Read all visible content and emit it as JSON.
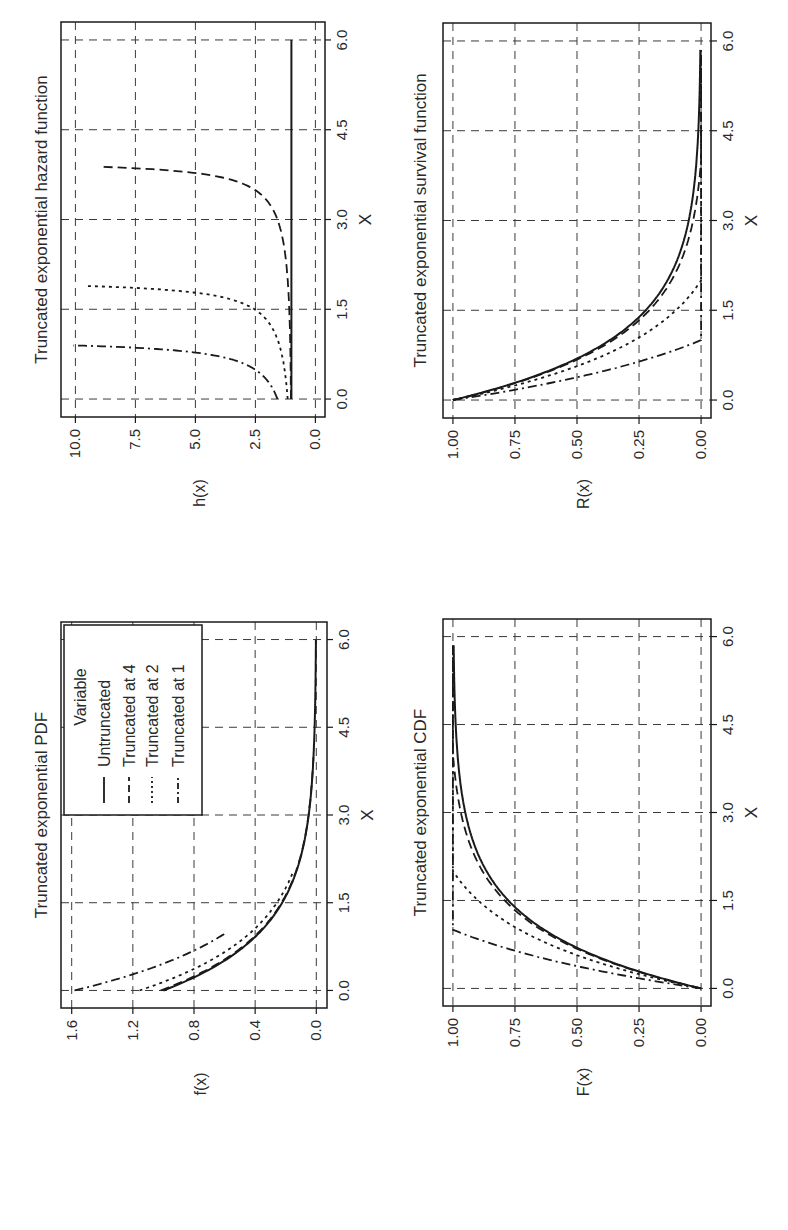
{
  "figure": {
    "rotation_deg": -90,
    "layout": "2x2 grid of line charts, page rotated 90 degrees counter-clockwise",
    "colors": {
      "background": "#ffffff",
      "ink": "#1a1a1a",
      "grid": "#3a3a3a"
    }
  },
  "legend": {
    "title": "Variable",
    "entries": [
      {
        "label": "Untruncated",
        "linestyle": "solid"
      },
      {
        "label": "Truncated at 4",
        "linestyle": "long-dash"
      },
      {
        "label": "Truncated at 2",
        "linestyle": "dotted"
      },
      {
        "label": "Truncated at 1",
        "linestyle": "dash-dot"
      }
    ]
  },
  "panels": {
    "pdf": {
      "title": "Truncated exponential PDF",
      "xlabel": "X",
      "ylabel": "f(x)",
      "xticks": [
        "0.0",
        "1.5",
        "3.0",
        "4.5",
        "6.0"
      ],
      "yticks": [
        "0.0",
        "0.4",
        "0.8",
        "1.2",
        "1.6"
      ]
    },
    "cdf": {
      "title": "Truncated exponential CDF",
      "xlabel": "X",
      "ylabel": "F(x)",
      "xticks": [
        "0.0",
        "1.5",
        "3.0",
        "4.5",
        "6.0"
      ],
      "yticks": [
        "0.00",
        "0.25",
        "0.50",
        "0.75",
        "1.00"
      ]
    },
    "hazard": {
      "title": "Truncated exponential hazard function",
      "xlabel": "X",
      "ylabel": "h(x)",
      "xticks": [
        "0.0",
        "1.5",
        "3.0",
        "4.5",
        "6.0"
      ],
      "yticks": [
        "0.0",
        "2.5",
        "5.0",
        "7.5",
        "10.0"
      ]
    },
    "survival": {
      "title": "Truncated exponential survival function",
      "xlabel": "X",
      "ylabel": "R(x)",
      "xticks": [
        "0.0",
        "1.5",
        "3.0",
        "4.5",
        "6.0"
      ],
      "yticks": [
        "0.00",
        "0.25",
        "0.50",
        "0.75",
        "1.00"
      ]
    }
  },
  "chart_data": [
    {
      "type": "line",
      "title": "Truncated exponential PDF",
      "xlabel": "X",
      "ylabel": "f(x)",
      "xlim": [
        -0.3,
        6.3
      ],
      "ylim": [
        -0.07,
        1.67
      ],
      "xticks": [
        0,
        1.5,
        3,
        4.5,
        6
      ],
      "yticks": [
        0,
        0.4,
        0.8,
        1.2,
        1.6
      ],
      "grid": true,
      "legend_position": "upper right",
      "x": [
        0,
        0.25,
        0.5,
        0.75,
        1.0,
        1.5,
        2.0,
        2.5,
        3.0,
        3.5,
        4.0,
        4.5,
        5.0,
        5.5,
        6.0
      ],
      "series": [
        {
          "name": "Untruncated",
          "linestyle": "solid",
          "values": [
            1.0,
            0.779,
            0.607,
            0.472,
            0.368,
            0.223,
            0.135,
            0.082,
            0.05,
            0.03,
            0.018,
            0.011,
            0.007,
            0.004,
            0.002
          ]
        },
        {
          "name": "Truncated at 4",
          "linestyle": "long-dash",
          "values": [
            1.019,
            0.793,
            0.618,
            0.481,
            0.375,
            0.227,
            0.138,
            0.084,
            0.051,
            0.031,
            0.019,
            null,
            null,
            null,
            null
          ]
        },
        {
          "name": "Truncated at 2",
          "linestyle": "dotted",
          "values": [
            1.157,
            0.901,
            0.702,
            0.546,
            0.426,
            0.258,
            0.156,
            null,
            null,
            null,
            null,
            null,
            null,
            null,
            null
          ]
        },
        {
          "name": "Truncated at 1",
          "linestyle": "dash-dot",
          "values": [
            1.582,
            1.232,
            0.96,
            0.747,
            0.582,
            null,
            null,
            null,
            null,
            null,
            null,
            null,
            null,
            null,
            null
          ]
        }
      ]
    },
    {
      "type": "line",
      "title": "Truncated exponential CDF",
      "xlabel": "X",
      "ylabel": "F(x)",
      "xlim": [
        -0.3,
        6.3
      ],
      "ylim": [
        -0.04,
        1.04
      ],
      "xticks": [
        0,
        1.5,
        3,
        4.5,
        6
      ],
      "yticks": [
        0,
        0.25,
        0.5,
        0.75,
        1.0
      ],
      "grid": true,
      "x": [
        0,
        0.25,
        0.5,
        0.75,
        1.0,
        1.5,
        2.0,
        2.5,
        3.0,
        3.5,
        4.0,
        4.5,
        5.0,
        5.5,
        6.0
      ],
      "series": [
        {
          "name": "Untruncated",
          "linestyle": "solid",
          "values": [
            0,
            0.221,
            0.393,
            0.528,
            0.632,
            0.777,
            0.865,
            0.918,
            0.95,
            0.97,
            0.982,
            0.989,
            0.993,
            0.996,
            0.998
          ]
        },
        {
          "name": "Truncated at 4",
          "linestyle": "long-dash",
          "values": [
            0,
            0.225,
            0.401,
            0.538,
            0.644,
            0.792,
            0.881,
            0.936,
            0.968,
            0.989,
            1.0,
            1.0,
            1.0,
            1.0,
            1.0
          ]
        },
        {
          "name": "Truncated at 2",
          "linestyle": "dotted",
          "values": [
            0,
            0.255,
            0.455,
            0.611,
            0.731,
            0.899,
            1.0,
            1.0,
            1.0,
            1.0,
            1.0,
            1.0,
            1.0,
            1.0,
            1.0
          ]
        },
        {
          "name": "Truncated at 1",
          "linestyle": "dash-dot",
          "values": [
            0,
            0.35,
            0.622,
            0.835,
            1.0,
            1.0,
            1.0,
            1.0,
            1.0,
            1.0,
            1.0,
            1.0,
            1.0,
            1.0,
            1.0
          ]
        }
      ]
    },
    {
      "type": "line",
      "title": "Truncated exponential hazard function",
      "xlabel": "X",
      "ylabel": "h(x)",
      "xlim": [
        -0.3,
        6.3
      ],
      "ylim": [
        -0.4,
        10.6
      ],
      "xticks": [
        0,
        1.5,
        3,
        4.5,
        6
      ],
      "yticks": [
        0,
        2.5,
        5,
        7.5,
        10
      ],
      "grid": true,
      "x": [
        0,
        0.25,
        0.5,
        0.75,
        0.9,
        1.0,
        1.5,
        1.75,
        1.9,
        2.0,
        2.5,
        3.0,
        3.5,
        3.75,
        3.9,
        4.0,
        4.5,
        5.0,
        5.5,
        6.0
      ],
      "series": [
        {
          "name": "Untruncated",
          "linestyle": "solid",
          "values": [
            1.0,
            1.0,
            1.0,
            1.0,
            1.0,
            1.0,
            1.0,
            1.0,
            1.0,
            1.0,
            1.0,
            1.0,
            1.0,
            1.0,
            1.0,
            1.0,
            1.0,
            1.0,
            1.0,
            1.0
          ]
        },
        {
          "name": "Truncated at 4",
          "linestyle": "long-dash",
          "values": [
            1.02,
            1.02,
            1.03,
            1.04,
            1.04,
            1.04,
            1.07,
            1.09,
            1.11,
            1.12,
            1.22,
            1.45,
            2.54,
            4.52,
            10.5,
            null,
            null,
            null,
            null,
            null
          ]
        },
        {
          "name": "Truncated at 2",
          "linestyle": "dotted",
          "values": [
            1.16,
            1.22,
            1.3,
            1.43,
            1.54,
            1.58,
            2.54,
            4.52,
            10.5,
            null,
            null,
            null,
            null,
            null,
            null,
            null,
            null,
            null,
            null,
            null
          ]
        },
        {
          "name": "Truncated at 1",
          "linestyle": "dash-dot",
          "values": [
            1.58,
            1.88,
            2.54,
            4.52,
            10.5,
            null,
            null,
            null,
            null,
            null,
            null,
            null,
            null,
            null,
            null,
            null,
            null,
            null,
            null,
            null
          ]
        }
      ]
    },
    {
      "type": "line",
      "title": "Truncated exponential survival function",
      "xlabel": "X",
      "ylabel": "R(x)",
      "xlim": [
        -0.3,
        6.3
      ],
      "ylim": [
        -0.04,
        1.04
      ],
      "xticks": [
        0,
        1.5,
        3,
        4.5,
        6
      ],
      "yticks": [
        0,
        0.25,
        0.5,
        0.75,
        1.0
      ],
      "grid": true,
      "x": [
        0,
        0.25,
        0.5,
        0.75,
        1.0,
        1.5,
        2.0,
        2.5,
        3.0,
        3.5,
        4.0,
        4.5,
        5.0,
        5.5,
        6.0
      ],
      "series": [
        {
          "name": "Untruncated",
          "linestyle": "solid",
          "values": [
            1.0,
            0.779,
            0.607,
            0.472,
            0.368,
            0.223,
            0.135,
            0.082,
            0.05,
            0.03,
            0.018,
            0.011,
            0.007,
            0.004,
            0.002
          ]
        },
        {
          "name": "Truncated at 4",
          "linestyle": "long-dash",
          "values": [
            1.0,
            0.775,
            0.599,
            0.462,
            0.356,
            0.208,
            0.119,
            0.064,
            0.032,
            0.011,
            0,
            0,
            0,
            0,
            0
          ]
        },
        {
          "name": "Truncated at 2",
          "linestyle": "dotted",
          "values": [
            1.0,
            0.745,
            0.545,
            0.389,
            0.269,
            0.101,
            0,
            0,
            0,
            0,
            0,
            0,
            0,
            0,
            0
          ]
        },
        {
          "name": "Truncated at 1",
          "linestyle": "dash-dot",
          "values": [
            1.0,
            0.65,
            0.378,
            0.165,
            0,
            0,
            0,
            0,
            0,
            0,
            0,
            0,
            0,
            0,
            0
          ]
        }
      ]
    }
  ]
}
